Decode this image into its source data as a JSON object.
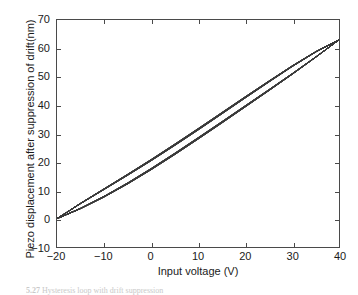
{
  "figure": {
    "caption_number": "5.27",
    "caption_text": "Hysteresis loop with drift suppression"
  },
  "colors": {
    "trace": "#3a3a3a",
    "axis": "#4a4a4a",
    "text": "#1a1a1a",
    "background": "#ffffff"
  },
  "chart_data": {
    "type": "line",
    "title": "",
    "subtitle": "",
    "xlabel": "Input voltage (V)",
    "ylabel": "Piezo displacement after suppression of drift(nm)",
    "xlim": [
      -20,
      40
    ],
    "ylim": [
      -10,
      70
    ],
    "xticks": [
      -20,
      -10,
      0,
      10,
      20,
      30,
      40
    ],
    "yticks": [
      -10,
      0,
      10,
      20,
      30,
      40,
      50,
      60,
      70
    ],
    "xtick_labels": [
      "−20",
      "−10",
      "0",
      "10",
      "20",
      "30",
      "40"
    ],
    "ytick_labels": [
      "−10",
      "0",
      "10",
      "20",
      "30",
      "40",
      "50",
      "60",
      "70"
    ],
    "grid": false,
    "legend": null,
    "legend_position": "none",
    "annotations": [],
    "series": [
      {
        "name": "Ascending branch (increasing voltage)",
        "x": [
          -20,
          -15,
          -10,
          -5,
          0,
          5,
          10,
          15,
          20,
          25,
          30,
          35,
          40
        ],
        "values": [
          0.0,
          3.5,
          7.6,
          12.2,
          17.2,
          22.5,
          28.0,
          33.6,
          39.3,
          45.0,
          50.8,
          56.8,
          63.0
        ]
      },
      {
        "name": "Descending branch (decreasing voltage)",
        "x": [
          -20,
          -15,
          -10,
          -5,
          0,
          5,
          10,
          15,
          20,
          25,
          30,
          35,
          40
        ],
        "values": [
          0.0,
          5.4,
          10.5,
          15.6,
          20.8,
          26.2,
          31.7,
          37.3,
          42.9,
          48.4,
          53.8,
          58.8,
          63.0
        ]
      }
    ],
    "loop_endpoints": {
      "lower_tip": [
        -20,
        0
      ],
      "upper_tip": [
        40,
        63
      ]
    },
    "max_loop_width_nm": 4.0,
    "num_cycles": 24
  }
}
